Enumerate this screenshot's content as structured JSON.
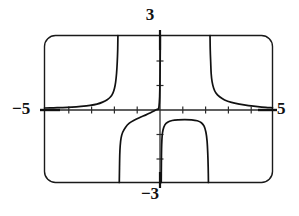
{
  "figure": {
    "kind": "graphing-calculator-window",
    "colors": {
      "background": "#ffffff",
      "frame": "#1a1a1a",
      "axis": "#2b2b2b",
      "curve": "#111111",
      "label": "#111111"
    },
    "labels": {
      "top": "3",
      "bottom": "−3",
      "left": "−5",
      "right": "5"
    }
  },
  "chart_data": {
    "type": "line",
    "title": "",
    "xlabel": "",
    "ylabel": "",
    "xlim": [
      -5,
      5
    ],
    "ylim": [
      -3,
      3
    ],
    "grid": false,
    "legend": null,
    "x_ticks": [
      -4,
      -3,
      -2,
      -1,
      1,
      2,
      3,
      4
    ],
    "y_ticks": [
      -2,
      -1,
      1,
      2
    ],
    "x_tick_labels": [
      "−5",
      "5"
    ],
    "y_tick_labels": [
      "−3",
      "3"
    ],
    "axes_visible": {
      "x_axis": true,
      "y_axis": true
    },
    "vertical_asymptotes": [
      -1.75,
      0.05,
      2.2
    ],
    "series": [
      {
        "name": "branch-upper-left",
        "comment": "Approaches y=0 from above at far left, rises steeply to top of window near x = -1.75",
        "points": [
          [
            -5.0,
            0.04
          ],
          [
            -4.6,
            0.05
          ],
          [
            -4.2,
            0.06
          ],
          [
            -3.8,
            0.08
          ],
          [
            -3.4,
            0.11
          ],
          [
            -3.0,
            0.15
          ],
          [
            -2.7,
            0.2
          ],
          [
            -2.45,
            0.28
          ],
          [
            -2.25,
            0.38
          ],
          [
            -2.1,
            0.5
          ],
          [
            -2.0,
            0.65
          ],
          [
            -1.93,
            0.85
          ],
          [
            -1.88,
            1.1
          ],
          [
            -1.84,
            1.45
          ],
          [
            -1.81,
            1.9
          ],
          [
            -1.79,
            2.4
          ],
          [
            -1.78,
            3.0
          ]
        ]
      },
      {
        "name": "branch-lower-left",
        "comment": "Drops from just left of origin down through the bottom of the window near x = -1.72",
        "points": [
          [
            -1.72,
            -3.0
          ],
          [
            -1.71,
            -2.4
          ],
          [
            -1.7,
            -1.9
          ],
          [
            -1.68,
            -1.5
          ],
          [
            -1.64,
            -1.18
          ],
          [
            -1.57,
            -0.95
          ],
          [
            -1.45,
            -0.75
          ],
          [
            -1.28,
            -0.58
          ],
          [
            -1.05,
            -0.45
          ],
          [
            -0.8,
            -0.34
          ],
          [
            -0.55,
            -0.24
          ],
          [
            -0.35,
            -0.15
          ],
          [
            -0.2,
            -0.08
          ],
          [
            -0.08,
            -0.02
          ],
          [
            0.0,
            0.0
          ]
        ]
      },
      {
        "name": "branch-center-up",
        "comment": "Rises steeply from the origin to the top of the window just left of x = 0.1",
        "points": [
          [
            0.0,
            0.0
          ],
          [
            0.02,
            0.1
          ],
          [
            0.035,
            0.25
          ],
          [
            0.05,
            0.5
          ],
          [
            0.06,
            0.9
          ],
          [
            0.068,
            1.4
          ],
          [
            0.073,
            1.9
          ],
          [
            0.077,
            2.4
          ],
          [
            0.08,
            3.0
          ]
        ]
      },
      {
        "name": "branch-center-down",
        "comment": "Falls from bottom of window just right of the y-axis, turns into a broad plateau at about y = -0.45, then drops again near x = 2.15",
        "points": [
          [
            0.12,
            -3.0
          ],
          [
            0.125,
            -2.4
          ],
          [
            0.13,
            -1.9
          ],
          [
            0.14,
            -1.45
          ],
          [
            0.16,
            -1.1
          ],
          [
            0.2,
            -0.85
          ],
          [
            0.28,
            -0.65
          ],
          [
            0.4,
            -0.54
          ],
          [
            0.6,
            -0.47
          ],
          [
            0.85,
            -0.44
          ],
          [
            1.15,
            -0.43
          ],
          [
            1.45,
            -0.44
          ],
          [
            1.7,
            -0.48
          ],
          [
            1.88,
            -0.56
          ],
          [
            2.0,
            -0.7
          ],
          [
            2.08,
            -0.95
          ],
          [
            2.13,
            -1.3
          ],
          [
            2.16,
            -1.8
          ],
          [
            2.18,
            -2.4
          ],
          [
            2.19,
            -3.0
          ]
        ]
      },
      {
        "name": "branch-upper-right",
        "comment": "Descends from the top of the window near x = 2.25 and flattens toward y = 0 at the right edge",
        "points": [
          [
            2.26,
            3.0
          ],
          [
            2.27,
            2.4
          ],
          [
            2.29,
            1.9
          ],
          [
            2.31,
            1.45
          ],
          [
            2.35,
            1.12
          ],
          [
            2.42,
            0.85
          ],
          [
            2.52,
            0.65
          ],
          [
            2.68,
            0.5
          ],
          [
            2.9,
            0.37
          ],
          [
            3.2,
            0.27
          ],
          [
            3.55,
            0.2
          ],
          [
            3.95,
            0.14
          ],
          [
            4.35,
            0.1
          ],
          [
            4.7,
            0.07
          ],
          [
            5.0,
            0.05
          ]
        ]
      }
    ]
  }
}
